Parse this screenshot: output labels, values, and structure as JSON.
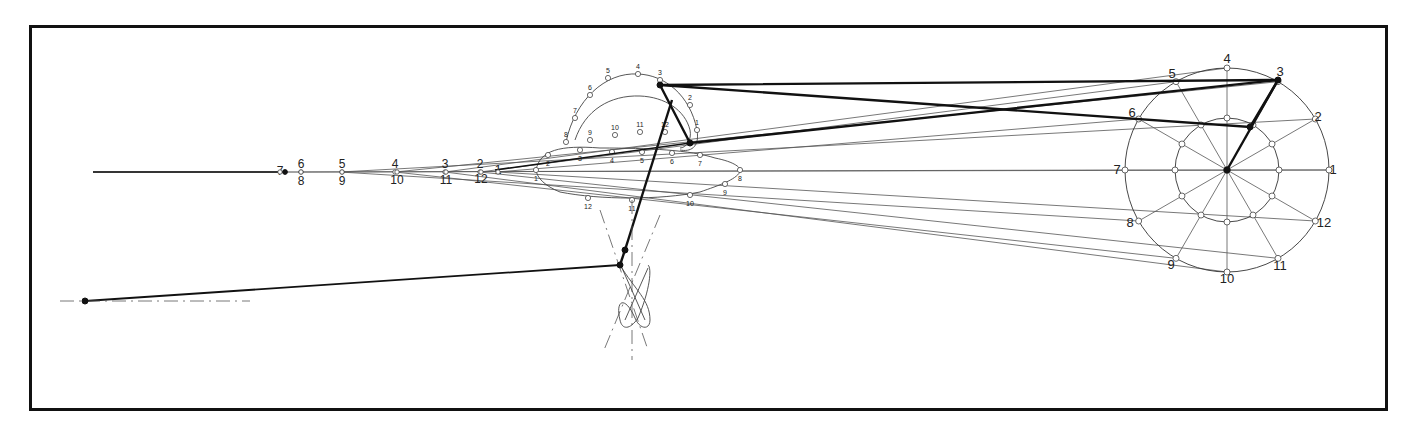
{
  "diagram": {
    "title": "",
    "type": "kinematic-linkage-mechanism",
    "frame": {
      "x": 29,
      "y": 25,
      "w": 1356,
      "h": 383,
      "border_color": "#111111"
    },
    "colors": {
      "ink": "#111111",
      "thin_line": "#555555",
      "background": "#ffffff"
    },
    "crank": {
      "center": [
        1227,
        170
      ],
      "outer_radius": 102,
      "inner_radius": 52,
      "outer_labels": [
        {
          "n": "1",
          "x": 1333,
          "y": 174
        },
        {
          "n": "2",
          "x": 1318,
          "y": 121
        },
        {
          "n": "3",
          "x": 1280,
          "y": 76
        },
        {
          "n": "4",
          "x": 1227,
          "y": 63
        },
        {
          "n": "5",
          "x": 1172,
          "y": 78
        },
        {
          "n": "6",
          "x": 1132,
          "y": 117
        },
        {
          "n": "7",
          "x": 1117,
          "y": 174
        },
        {
          "n": "8",
          "x": 1130,
          "y": 227
        },
        {
          "n": "9",
          "x": 1171,
          "y": 269
        },
        {
          "n": "10",
          "x": 1227,
          "y": 283
        },
        {
          "n": "11",
          "x": 1280,
          "y": 270
        },
        {
          "n": "12",
          "x": 1324,
          "y": 227
        }
      ]
    },
    "left_fan_labels": {
      "top": [
        {
          "n": "7",
          "x": 280,
          "y": 175
        },
        {
          "n": "6",
          "x": 301,
          "y": 168
        },
        {
          "n": "5",
          "x": 342,
          "y": 168
        },
        {
          "n": "4",
          "x": 395,
          "y": 168
        },
        {
          "n": "3",
          "x": 445,
          "y": 168
        },
        {
          "n": "2",
          "x": 480,
          "y": 168
        },
        {
          "n": "1",
          "x": 498,
          "y": 174
        }
      ],
      "bottom": [
        {
          "n": "8",
          "x": 301,
          "y": 185
        },
        {
          "n": "9",
          "x": 342,
          "y": 185
        },
        {
          "n": "10",
          "x": 397,
          "y": 184
        },
        {
          "n": "11",
          "x": 446,
          "y": 184
        },
        {
          "n": "12",
          "x": 481,
          "y": 183
        }
      ]
    },
    "coupler_upper_curve_labels": [
      "1",
      "2",
      "3",
      "4",
      "5",
      "6",
      "7",
      "8",
      "9",
      "10",
      "11",
      "12"
    ],
    "coupler_lower_curve_labels": [
      "1",
      "2",
      "3",
      "4",
      "5",
      "6",
      "7",
      "8",
      "9",
      "10",
      "11",
      "12"
    ],
    "ground_pivot_left": {
      "x": 85,
      "y": 301
    },
    "rocker_pivot": {
      "x": 620,
      "y": 265
    }
  }
}
